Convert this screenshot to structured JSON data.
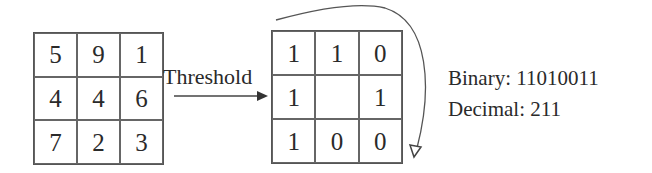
{
  "diagram": {
    "input_grid": {
      "cells": [
        [
          "5",
          "9",
          "1"
        ],
        [
          "4",
          "4",
          "6"
        ],
        [
          "7",
          "2",
          "3"
        ]
      ]
    },
    "operation_label": "Threshold",
    "binary_grid": {
      "cells": [
        [
          "1",
          "1",
          "0"
        ],
        [
          "1",
          "",
          "1"
        ],
        [
          "1",
          "0",
          "0"
        ]
      ]
    },
    "result": {
      "binary_text": "Binary: 11010011",
      "decimal_text": "Decimal: 211"
    },
    "colors": {
      "line": "#555555",
      "text": "#2a2a2a"
    }
  }
}
